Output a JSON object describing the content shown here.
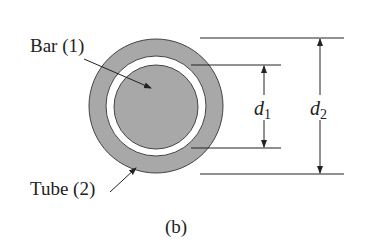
{
  "figure": {
    "labels": {
      "bar": "Bar (1)",
      "tube": "Tube (2)",
      "caption": "(b)",
      "d1_main": "d",
      "d1_sub": "1",
      "d2_main": "d",
      "d2_sub": "2"
    },
    "colors": {
      "fill": "#a8a8a8",
      "stroke": "#333333",
      "gap": "#ffffff"
    }
  }
}
